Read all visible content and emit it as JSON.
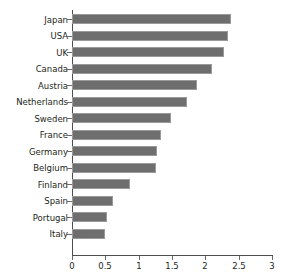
{
  "chart_data": {
    "type": "bar",
    "orientation": "horizontal",
    "title": "",
    "subtitle": "",
    "xlabel": "",
    "ylabel": "",
    "xlim": [
      0,
      3
    ],
    "xticks": [
      "0",
      "0.5",
      "1",
      "1.5",
      "2",
      "2.5",
      "3"
    ],
    "xtick_values": [
      0,
      0.5,
      1,
      1.5,
      2,
      2.5,
      3
    ],
    "grid": false,
    "legend": false,
    "legend_position": "none",
    "bar_color": "#6e6e6e",
    "axis_color": "#4d4d4d",
    "background": "#ffffff",
    "categories": [
      "Japan",
      "USA",
      "UK",
      "Canada",
      "Austria",
      "Netherlands",
      "Sweden",
      "France",
      "Germany",
      "Belgium",
      "Finland",
      "Spain",
      "Portugal",
      "Italy"
    ],
    "values": [
      2.38,
      2.34,
      2.28,
      2.1,
      1.88,
      1.72,
      1.48,
      1.33,
      1.28,
      1.26,
      0.87,
      0.62,
      0.53,
      0.5
    ]
  }
}
